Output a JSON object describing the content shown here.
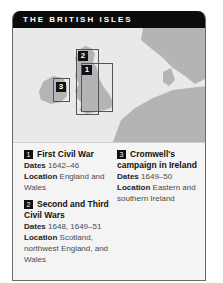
{
  "panel": {
    "title": "THE BRITISH ISLES"
  },
  "map": {
    "markers": [
      {
        "id": "1",
        "label": "1"
      },
      {
        "id": "2",
        "label": "2"
      },
      {
        "id": "3",
        "label": "3"
      }
    ],
    "colors": {
      "sea": "#e9e9e9",
      "land": "#b4b4b4",
      "marker_bg": "#111111"
    }
  },
  "legend": {
    "items": [
      {
        "number": "1",
        "title": "First Civil War",
        "dates_label": "Dates",
        "dates": "1642–46",
        "location_label": "Location",
        "location": "England and Wales"
      },
      {
        "number": "2",
        "title": "Second and Third Civil Wars",
        "dates_label": "Dates",
        "dates": "1648, 1649–51",
        "location_label": "Location",
        "location": "Scotland, northwest England, and Wales"
      },
      {
        "number": "3",
        "title": "Cromwell's campaign in Ireland",
        "dates_label": "Dates",
        "dates": "1649–50",
        "location_label": "Location",
        "location": "Eastern and southern Ireland"
      }
    ]
  }
}
